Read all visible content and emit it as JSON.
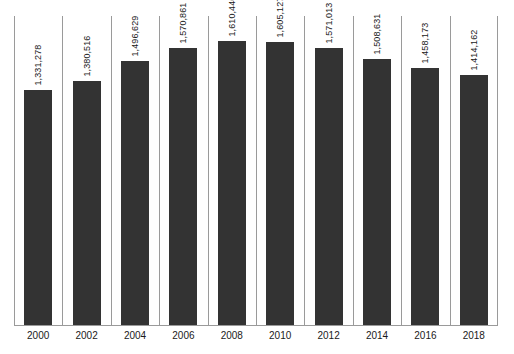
{
  "chart_data": {
    "type": "bar",
    "title": "",
    "xlabel": "",
    "ylabel": "",
    "categories": [
      "2000",
      "2002",
      "2004",
      "2006",
      "2008",
      "2010",
      "2012",
      "2014",
      "2016",
      "2018"
    ],
    "values": [
      1331278,
      1380516,
      1496629,
      1570861,
      1610446,
      1605127,
      1571013,
      1508631,
      1458173,
      1414162
    ],
    "value_labels": [
      "1,331,278",
      "1,380,516",
      "1,496,629",
      "1,570,861",
      "1,610,446",
      "1,605,127",
      "1,571,013",
      "1,508,631",
      "1,458,173",
      "1,414,162"
    ],
    "ylim": [
      0,
      1750000
    ],
    "grid": "vertical-category-separators",
    "legend": "none",
    "series": [
      {
        "name": "",
        "values": [
          1331278,
          1380516,
          1496629,
          1570861,
          1610446,
          1605127,
          1571013,
          1508631,
          1458173,
          1414162
        ]
      }
    ],
    "colors": {
      "bar": "#333333",
      "gridline": "#9a9a9a",
      "axis": "#9a9a9a",
      "label_text": "#1a1a1a",
      "background": "#ffffff"
    }
  }
}
